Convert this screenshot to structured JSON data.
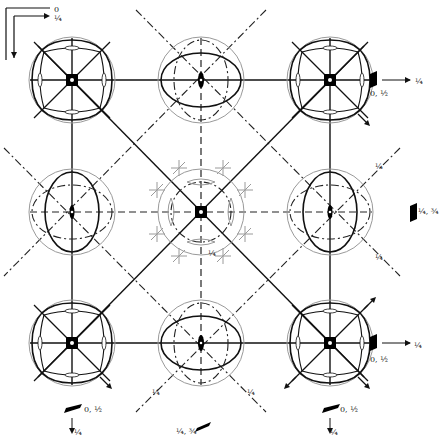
{
  "diagram": {
    "type": "space-group symmetry diagram (tetragonal, projection along c)",
    "axes": {
      "origin_label": "0",
      "x_label": "a",
      "y_label": "b",
      "corner_tick_label": "¼"
    },
    "grid": {
      "rows": 3,
      "cols": 3,
      "centers_x": [
        72,
        201,
        330
      ],
      "centers_y": [
        80,
        212,
        343
      ],
      "stereo_radius": 43
    },
    "nodes": [
      {
        "id": "r0c0",
        "kind": "4-fold",
        "label": ""
      },
      {
        "id": "r0c1",
        "kind": "2-fold",
        "label": ""
      },
      {
        "id": "r0c2",
        "kind": "4-fold",
        "label": ""
      },
      {
        "id": "r1c0",
        "kind": "2-fold",
        "label": ""
      },
      {
        "id": "r1c1",
        "kind": "4-fold-center",
        "label": ""
      },
      {
        "id": "r1c2",
        "kind": "2-fold",
        "label": ""
      },
      {
        "id": "r2c0",
        "kind": "4-fold",
        "label": ""
      },
      {
        "id": "r2c1",
        "kind": "2-fold",
        "label": ""
      },
      {
        "id": "r2c2",
        "kind": "4-fold",
        "label": ""
      }
    ],
    "plane_labels": {
      "right_top": "0, ½",
      "right_mid": "¼, ¾",
      "right_bottom": "0, ½",
      "bottom_left": "0, ½",
      "bottom_mid": "¼, ¾",
      "bottom_right": "0, ½"
    },
    "height_labels": {
      "fraction_quarter": "¼",
      "arrow_right_top": "¼",
      "arrow_right_bottom": "¼",
      "arrow_bottom_left": "¼",
      "arrow_bottom_right": "¼"
    },
    "colors": {
      "line": "#111111",
      "circle": "#9a9a9a",
      "glide": "#222222",
      "symbol_fill": "#000000"
    }
  }
}
